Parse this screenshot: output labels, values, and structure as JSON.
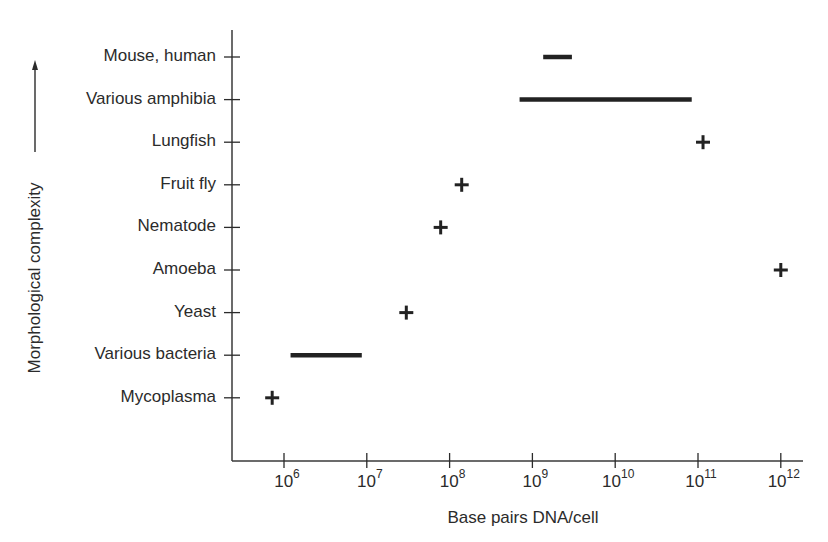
{
  "chart_data": {
    "type": "scatter",
    "title": "",
    "xlabel": "Base pairs DNA/cell",
    "ylabel": "Morphological complexity",
    "x_scale": "log",
    "xlim": [
      200000,
      2000000000000
    ],
    "x_ticks": [
      {
        "exp": 6,
        "base": "10",
        "sup": "6"
      },
      {
        "exp": 7,
        "base": "10",
        "sup": "7"
      },
      {
        "exp": 8,
        "base": "10",
        "sup": "8"
      },
      {
        "exp": 9,
        "base": "10",
        "sup": "9"
      },
      {
        "exp": 10,
        "base": "10",
        "sup": "10"
      },
      {
        "exp": 11,
        "base": "10",
        "sup": "11"
      },
      {
        "exp": 12,
        "base": "10",
        "sup": "12"
      }
    ],
    "grid": false,
    "legend": null,
    "categories": [
      "Mouse, human",
      "Various amphibia",
      "Lungfish",
      "Fruit fly",
      "Nematode",
      "Amoeba",
      "Yeast",
      "Various bacteria",
      "Mycoplasma"
    ],
    "series": [
      {
        "category": "Mouse, human",
        "marker": "range",
        "min": 1350000000,
        "max": 3000000000
      },
      {
        "category": "Various amphibia",
        "marker": "range",
        "min": 700000000,
        "max": 84000000000
      },
      {
        "category": "Lungfish",
        "marker": "point",
        "value": 115000000000
      },
      {
        "category": "Fruit fly",
        "marker": "point",
        "value": 140000000
      },
      {
        "category": "Nematode",
        "marker": "point",
        "value": 78000000
      },
      {
        "category": "Amoeba",
        "marker": "point",
        "value": 1000000000000
      },
      {
        "category": "Yeast",
        "marker": "point",
        "value": 30000000
      },
      {
        "category": "Various bacteria",
        "marker": "range",
        "min": 1200000,
        "max": 8700000
      },
      {
        "category": "Mycoplasma",
        "marker": "point",
        "value": 720000
      }
    ],
    "annotations": [
      "upward arrow beside y-axis label indicating increasing complexity"
    ]
  },
  "colors": {
    "ink": "#2b2b2b",
    "marker": "#222222",
    "background": "#ffffff"
  }
}
